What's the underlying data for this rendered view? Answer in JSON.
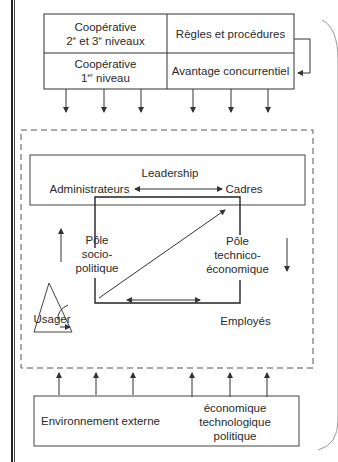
{
  "top_box": {
    "coop_23": {
      "line1": "Coopérative",
      "line2_num1": "2",
      "line2_sup1": "e",
      "line2_mid": " et 3",
      "line2_sup2": "e",
      "line2_end": " niveaux"
    },
    "coop_1": {
      "line1": "Coopérative",
      "line2_num": "1",
      "line2_sup": "er",
      "line2_end": " niveau"
    },
    "rules": "Règles et procédures",
    "advantage": "Avantage concurrentiel"
  },
  "center": {
    "leadership": "Leadership",
    "administrators": "Administrateurs",
    "managers": "Cadres",
    "pole_socio": {
      "line1": "Pôle",
      "line2": "socio-",
      "line3": "politique"
    },
    "pole_techno": {
      "line1": "Pôle",
      "line2": "technico-",
      "line3": "économique"
    },
    "employees": "Employés",
    "user": "Usager"
  },
  "bottom_box": {
    "environment": "Environnement externe",
    "factors": [
      "économique",
      "technologique",
      "politique"
    ]
  },
  "colors": {
    "line": "#333333",
    "dash": "#555555",
    "bracket": "#888888"
  }
}
